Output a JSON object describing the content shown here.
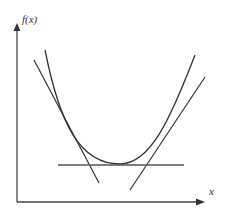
{
  "diagram": {
    "title": "",
    "y_axis_label": "f(x)",
    "x_axis_label": "x",
    "elements": [
      {
        "name": "y-axis",
        "type": "arrow",
        "direction": "up"
      },
      {
        "name": "x-axis",
        "type": "arrow",
        "direction": "right"
      },
      {
        "name": "convex-curve",
        "type": "curve",
        "shape": "U-shaped parabola with minimum near center-bottom"
      },
      {
        "name": "left-tangent-line",
        "type": "line",
        "slope": "negative",
        "touches": "left branch of curve"
      },
      {
        "name": "right-tangent-line",
        "type": "line",
        "slope": "positive",
        "touches": "right branch of curve"
      },
      {
        "name": "horizontal-tangent-line",
        "type": "line",
        "slope": "zero",
        "touches": "curve minimum"
      }
    ],
    "colors": {
      "stroke": "#333333",
      "background": "#ffffff"
    }
  }
}
